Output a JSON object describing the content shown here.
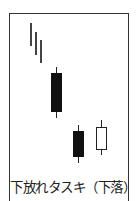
{
  "chart_data": {
    "type": "candlestick",
    "title": "下放れタスキ（下落）",
    "pattern_name": "下放れタスキ",
    "pattern_direction": "下落",
    "xlabel": "",
    "ylabel": "",
    "grid": false,
    "legend": null,
    "trend_lines": [
      {
        "x": 30,
        "y_top": 23,
        "y_bottom": 46
      },
      {
        "x": 35,
        "y_top": 32,
        "y_bottom": 55
      },
      {
        "x": 40,
        "y_top": 40,
        "y_bottom": 63
      }
    ],
    "candles": [
      {
        "index": 1,
        "color": "black",
        "direction": "bearish",
        "left": 51,
        "width": 11,
        "wick_top": 67,
        "body_top": 73,
        "body_bottom": 112,
        "wick_bottom": 118
      },
      {
        "index": 2,
        "color": "black",
        "direction": "bearish",
        "left": 73,
        "width": 11,
        "wick_top": 125,
        "body_top": 131,
        "body_bottom": 157,
        "wick_bottom": 163
      },
      {
        "index": 3,
        "color": "white",
        "direction": "bullish",
        "left": 96,
        "width": 11,
        "wick_top": 120,
        "body_top": 127,
        "body_bottom": 150,
        "wick_bottom": 155
      }
    ],
    "colors": {
      "frame": "#333333",
      "bearish": "#111111",
      "bullish_fill": "#ffffff",
      "bullish_stroke": "#222222",
      "trend_line": "#444444"
    }
  },
  "caption": "下放れタスキ（下落）"
}
